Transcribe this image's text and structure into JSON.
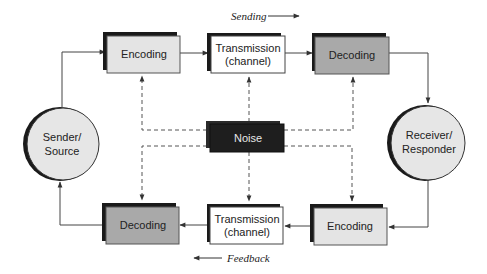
{
  "diagram": {
    "type": "communication-process-model",
    "flow_labels": {
      "sending": "Sending",
      "feedback": "Feedback"
    },
    "nodes": {
      "sender": {
        "line1": "Sender/",
        "line2": "Source"
      },
      "receiver": {
        "line1": "Receiver/",
        "line2": "Responder"
      },
      "top_encoding": {
        "label": "Encoding"
      },
      "top_transmission": {
        "line1": "Transmission",
        "line2": "(channel)"
      },
      "top_decoding": {
        "label": "Decoding"
      },
      "noise": {
        "label": "Noise"
      },
      "bottom_decoding": {
        "label": "Decoding"
      },
      "bottom_transmission": {
        "line1": "Transmission",
        "line2": "(channel)"
      },
      "bottom_encoding": {
        "label": "Encoding"
      }
    },
    "edges": [
      {
        "from": "sender",
        "to": "top_encoding",
        "style": "solid"
      },
      {
        "from": "top_encoding",
        "to": "top_transmission",
        "style": "solid"
      },
      {
        "from": "top_transmission",
        "to": "top_decoding",
        "style": "solid"
      },
      {
        "from": "top_decoding",
        "to": "receiver",
        "style": "solid"
      },
      {
        "from": "receiver",
        "to": "bottom_encoding",
        "style": "solid"
      },
      {
        "from": "bottom_encoding",
        "to": "bottom_transmission",
        "style": "solid"
      },
      {
        "from": "bottom_transmission",
        "to": "bottom_decoding",
        "style": "solid"
      },
      {
        "from": "bottom_decoding",
        "to": "sender",
        "style": "solid"
      },
      {
        "from": "noise",
        "to": "top_encoding",
        "style": "dashed"
      },
      {
        "from": "noise",
        "to": "top_transmission",
        "style": "dashed"
      },
      {
        "from": "noise",
        "to": "top_decoding",
        "style": "dashed"
      },
      {
        "from": "noise",
        "to": "bottom_decoding",
        "style": "dashed"
      },
      {
        "from": "noise",
        "to": "bottom_transmission",
        "style": "dashed"
      },
      {
        "from": "noise",
        "to": "bottom_encoding",
        "style": "dashed"
      }
    ],
    "colors": {
      "encoding_fill": "#e4e4e4",
      "decoding_fill": "#a9a9a9",
      "transmission_fill": "#ffffff",
      "noise_fill": "#1e1e1e",
      "circle_fill": "#e6e6e6",
      "shadow": "#1a1a1a"
    }
  }
}
